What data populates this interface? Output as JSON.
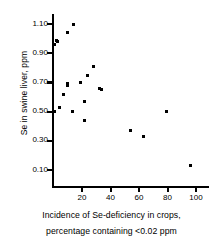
{
  "chart_data": {
    "type": "scatter",
    "title": "",
    "xlabel": "Incidence of Se-deficiency in crops, percentage containing <0.02 ppm",
    "xlabel_line1": "Incidence of Se-deficiency in crops,",
    "xlabel_line2": "percentage containing <0.02 ppm",
    "ylabel": "Se in swine liver, ppm",
    "xlim": [
      0,
      108
    ],
    "ylim": [
      0.0,
      1.18
    ],
    "xticks": [
      20,
      40,
      60,
      80,
      100
    ],
    "xtick_labels": [
      "20",
      "40",
      "60",
      "80",
      "100"
    ],
    "yticks": [
      0.1,
      0.3,
      0.5,
      0.7,
      0.9,
      1.1
    ],
    "ytick_labels": [
      "0.10",
      "0.30",
      "0.50",
      "0.70",
      "0.90",
      "1.10"
    ],
    "grid": false,
    "legend": null,
    "marker": "square",
    "marker_color": "#000000",
    "axis_color": "#000000",
    "background_color": "#ffffff",
    "x": [
      14.0,
      9.5,
      2.0,
      2.5,
      1.0,
      28.0,
      24.0,
      19.0,
      9.5,
      10.0,
      32.0,
      34.0,
      7.0,
      22.0,
      4.5,
      79.0,
      13.0,
      1.0,
      22.0,
      54.0,
      63.0,
      96.0
    ],
    "y": [
      1.1,
      1.04,
      0.99,
      0.98,
      0.96,
      0.81,
      0.75,
      0.7,
      0.69,
      0.68,
      0.66,
      0.65,
      0.62,
      0.57,
      0.53,
      0.5,
      0.5,
      0.5,
      0.44,
      0.37,
      0.33,
      0.13
    ],
    "points": [
      {
        "x": 14.0,
        "y": 1.1
      },
      {
        "x": 9.5,
        "y": 1.04
      },
      {
        "x": 2.0,
        "y": 0.99
      },
      {
        "x": 2.5,
        "y": 0.98
      },
      {
        "x": 1.0,
        "y": 0.96
      },
      {
        "x": 28.0,
        "y": 0.81
      },
      {
        "x": 24.0,
        "y": 0.75
      },
      {
        "x": 19.0,
        "y": 0.7
      },
      {
        "x": 9.5,
        "y": 0.69
      },
      {
        "x": 10.0,
        "y": 0.68
      },
      {
        "x": 32.0,
        "y": 0.66
      },
      {
        "x": 34.0,
        "y": 0.65
      },
      {
        "x": 7.0,
        "y": 0.62
      },
      {
        "x": 22.0,
        "y": 0.57
      },
      {
        "x": 4.5,
        "y": 0.53
      },
      {
        "x": 79.0,
        "y": 0.5
      },
      {
        "x": 13.0,
        "y": 0.5
      },
      {
        "x": 1.0,
        "y": 0.5
      },
      {
        "x": 22.0,
        "y": 0.44
      },
      {
        "x": 54.0,
        "y": 0.37
      },
      {
        "x": 63.0,
        "y": 0.33
      },
      {
        "x": 96.0,
        "y": 0.13
      }
    ]
  }
}
